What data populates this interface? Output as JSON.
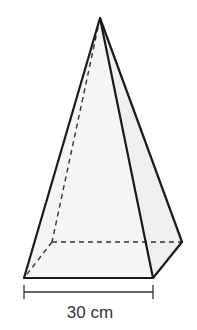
{
  "figure": {
    "shape": "square-based pyramid",
    "dimension_label": "30 cm",
    "face_fill": "#f4f4f4",
    "edge_color": "#1a1a1a"
  }
}
